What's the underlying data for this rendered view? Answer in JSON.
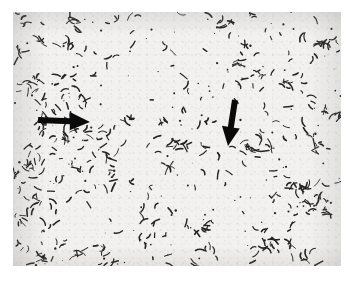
{
  "figure": {
    "kind": "photomicrograph",
    "plate": {
      "x": 13,
      "y": 12,
      "width": 328,
      "height": 254,
      "background_color": "#f2f1ef",
      "specimen_color": "#242424"
    },
    "margins": {
      "color": "#ffffff",
      "left": 13,
      "top": 12,
      "right": 13,
      "bottom": 16
    }
  },
  "annotations": {
    "arrow_color": "#0a0a0a",
    "items": [
      {
        "name": "arrow-left-horizontal",
        "direction": "right",
        "tail_x": 38,
        "tail_y": 120,
        "tip_x": 90,
        "tip_y": 122,
        "shaft_thickness": 6,
        "head_length": 20,
        "head_half_width": 9
      },
      {
        "name": "arrow-center-vertical",
        "direction": "down",
        "tail_x": 235,
        "tail_y": 100,
        "tip_x": 228,
        "tip_y": 146,
        "shaft_thickness": 6,
        "head_length": 19,
        "head_half_width": 9
      }
    ]
  },
  "chart_data": {
    "type": "scatter",
    "title": "",
    "xlabel": "",
    "ylabel": "",
    "xlim": [
      0,
      328
    ],
    "ylim": [
      0,
      254
    ],
    "grid": false,
    "legend": null,
    "marker": "short dark rod",
    "point_count": 520,
    "seed": 20240516
  }
}
